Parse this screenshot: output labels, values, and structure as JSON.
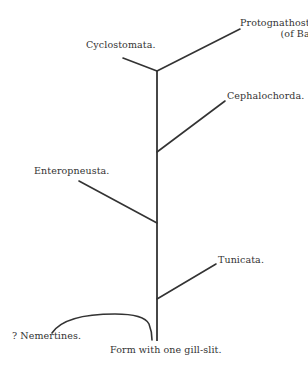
{
  "diagram": {
    "type": "phylogenetic-tree",
    "stroke_color": "#333333",
    "background": "#ffffff",
    "root": {
      "label": "Form with one gill-slit."
    },
    "branches": [
      {
        "id": "cyclostomata",
        "label": "Cyclostomata."
      },
      {
        "id": "protognathostomata",
        "label": "Protognathostomata",
        "sublabel": "(of Balfour)."
      },
      {
        "id": "cephalochorda",
        "label": "Cephalochorda."
      },
      {
        "id": "enteropneusta",
        "label": "Enteropneusta."
      },
      {
        "id": "tunicata",
        "label": "Tunicata."
      },
      {
        "id": "nemertines",
        "label": "? Nemertines."
      }
    ]
  }
}
